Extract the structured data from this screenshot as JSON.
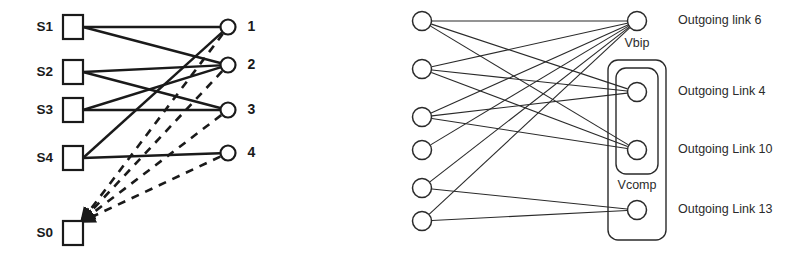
{
  "figures": {
    "left": {
      "name": "state-transition-bipartite",
      "source_nodes": [
        {
          "id": "S1",
          "label": "S1",
          "shape": "square",
          "cx": 73,
          "cy": 27
        },
        {
          "id": "S2",
          "label": "S2",
          "shape": "square",
          "cx": 73,
          "cy": 72
        },
        {
          "id": "S3",
          "label": "S3",
          "shape": "square",
          "cx": 73,
          "cy": 110
        },
        {
          "id": "S4",
          "label": "S4",
          "shape": "square",
          "cx": 73,
          "cy": 158
        },
        {
          "id": "S0",
          "label": "S0",
          "shape": "square",
          "cx": 73,
          "cy": 233
        }
      ],
      "target_nodes": [
        {
          "id": "T1",
          "label": "1",
          "shape": "circle",
          "cx": 228,
          "cy": 27
        },
        {
          "id": "T2",
          "label": "2",
          "shape": "circle",
          "cx": 228,
          "cy": 65
        },
        {
          "id": "T3",
          "label": "3",
          "shape": "circle",
          "cx": 228,
          "cy": 110
        },
        {
          "id": "T4",
          "label": "4",
          "shape": "circle",
          "cx": 228,
          "cy": 153
        }
      ],
      "solid_edges": [
        {
          "from": "S1",
          "to": "T1"
        },
        {
          "from": "S1",
          "to": "T2"
        },
        {
          "from": "S2",
          "to": "T2"
        },
        {
          "from": "S2",
          "to": "T3"
        },
        {
          "from": "S3",
          "to": "T2"
        },
        {
          "from": "S3",
          "to": "T3"
        },
        {
          "from": "S4",
          "to": "T1"
        },
        {
          "from": "S4",
          "to": "T4"
        }
      ],
      "dashed_edges": [
        {
          "from": "T1",
          "to": "S0"
        },
        {
          "from": "T2",
          "to": "S0"
        },
        {
          "from": "T3",
          "to": "S0"
        },
        {
          "from": "T4",
          "to": "S0"
        }
      ],
      "edge_style": {
        "solid": "solid",
        "dashed": "dashed-with-arrow"
      }
    },
    "right": {
      "name": "outgoing-link-bipartite",
      "source_nodes": [
        {
          "id": "L1",
          "cx": 422,
          "cy": 21
        },
        {
          "id": "L2",
          "cx": 422,
          "cy": 69
        },
        {
          "id": "L3",
          "cx": 422,
          "cy": 117
        },
        {
          "id": "L4",
          "cx": 422,
          "cy": 150
        },
        {
          "id": "L5",
          "cx": 422,
          "cy": 188
        },
        {
          "id": "L6",
          "cx": 422,
          "cy": 221
        }
      ],
      "target_nodes": [
        {
          "id": "R6",
          "label": "Outgoing link 6",
          "cx": 637,
          "cy": 21
        },
        {
          "id": "R4",
          "label": "Outgoing Link 4",
          "cx": 637,
          "cy": 92
        },
        {
          "id": "R10",
          "label": "Outgoing Link 10",
          "cx": 637,
          "cy": 150
        },
        {
          "id": "R13",
          "label": "Outgoing Link 13",
          "cx": 637,
          "cy": 210
        }
      ],
      "group_labels": [
        {
          "id": "vbip",
          "label": "Vbip",
          "x": 637,
          "y": 44
        },
        {
          "id": "vcomp",
          "label": "Vcomp",
          "x": 637,
          "y": 186
        }
      ],
      "edges": [
        {
          "from": "L1",
          "to": "R6"
        },
        {
          "from": "L1",
          "to": "R4"
        },
        {
          "from": "L1",
          "to": "R10"
        },
        {
          "from": "L2",
          "to": "R6"
        },
        {
          "from": "L2",
          "to": "R4"
        },
        {
          "from": "L2",
          "to": "R10"
        },
        {
          "from": "L3",
          "to": "R6"
        },
        {
          "from": "L3",
          "to": "R4"
        },
        {
          "from": "L3",
          "to": "R10"
        },
        {
          "from": "L4",
          "to": "R6"
        },
        {
          "from": "L5",
          "to": "R6"
        },
        {
          "from": "L5",
          "to": "R13"
        },
        {
          "from": "L6",
          "to": "R6"
        },
        {
          "from": "L6",
          "to": "R13"
        }
      ],
      "boxes": [
        {
          "id": "outer-box",
          "x": 608,
          "y": 60,
          "w": 58,
          "h": 180,
          "rx": 10
        },
        {
          "id": "inner-box",
          "x": 616,
          "y": 68,
          "w": 42,
          "h": 106,
          "rx": 10
        }
      ]
    }
  },
  "colors": {
    "stroke": "#1a1a1a",
    "thin_stroke": "#2a2a2a",
    "background": "#ffffff",
    "text": "#1a1a1a"
  }
}
